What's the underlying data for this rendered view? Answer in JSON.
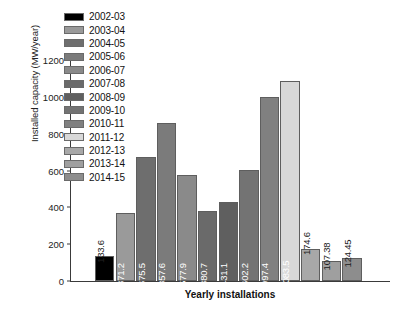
{
  "chart_data": {
    "type": "bar",
    "title": "",
    "xlabel": "Yearly installations",
    "ylabel": "Installed capacity (MW/year)",
    "ylim": [
      0,
      1200
    ],
    "yticks": [
      0,
      200,
      400,
      600,
      800,
      1000,
      1200
    ],
    "grid": false,
    "legend_position": "top-left",
    "categories": [
      "2002-03",
      "2003-04",
      "2004-05",
      "2005-06",
      "2006-07",
      "2007-08",
      "2008-09",
      "2009-10",
      "2010-11",
      "2011-12",
      "2012-13",
      "2013-14",
      "2014-15"
    ],
    "values": [
      133.6,
      371.2,
      675.5,
      857.6,
      577.9,
      380.7,
      431.1,
      602.2,
      997.4,
      1083.5,
      174.6,
      107.38,
      124.45
    ],
    "value_labels": [
      "133.6",
      "371.2",
      "675.5",
      "857.6",
      "577.9",
      "380.7",
      "431.1",
      "602.2",
      "997.4",
      "1083.5",
      "174.6",
      "107.38",
      "124.45"
    ],
    "bar_colors": [
      "#000000",
      "#9a9a9a",
      "#6e6e6e",
      "#7b7b7b",
      "#8a8a8a",
      "#6a6a6a",
      "#5f5f5f",
      "#737373",
      "#808080",
      "#d8d8d8",
      "#a8a8a8",
      "#9f9f9f",
      "#8d8d8d"
    ],
    "label_placement": [
      "outside",
      "inside",
      "inside",
      "inside",
      "inside",
      "inside",
      "inside",
      "inside",
      "inside",
      "inside",
      "outside",
      "outside",
      "outside"
    ]
  },
  "legend": {
    "items": [
      {
        "label": "2002-03",
        "color": "#000000"
      },
      {
        "label": "2003-04",
        "color": "#9a9a9a"
      },
      {
        "label": "2004-05",
        "color": "#6e6e6e"
      },
      {
        "label": "2005-06",
        "color": "#7b7b7b"
      },
      {
        "label": "2006-07",
        "color": "#8a8a8a"
      },
      {
        "label": "2007-08",
        "color": "#6a6a6a"
      },
      {
        "label": "2008-09",
        "color": "#5f5f5f"
      },
      {
        "label": "2009-10",
        "color": "#737373"
      },
      {
        "label": "2010-11",
        "color": "#808080"
      },
      {
        "label": "2011-12",
        "color": "#d8d8d8"
      },
      {
        "label": "2012-13",
        "color": "#a8a8a8"
      },
      {
        "label": "2013-14",
        "color": "#9f9f9f"
      },
      {
        "label": "2014-15",
        "color": "#8d8d8d"
      }
    ]
  },
  "axis": {
    "y_title": "Installed capacity (MW/year)",
    "x_title": "Yearly installations",
    "y_tick_labels": [
      "0",
      "200",
      "400",
      "600",
      "800",
      "1000",
      "1200"
    ]
  }
}
